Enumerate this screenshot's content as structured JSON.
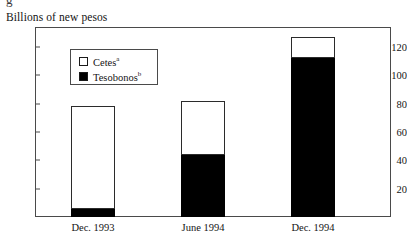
{
  "figure": {
    "top_clipped_glyph": "g",
    "axis_title": "Billions of new pesos"
  },
  "legend": {
    "position": "inside-top-left",
    "items": [
      {
        "label": "Cetes",
        "footnote": "a",
        "swatch": "white-square-swatch"
      },
      {
        "label": "Tesobonos",
        "footnote": "b",
        "swatch": "black-square-swatch"
      }
    ]
  },
  "chart_data": {
    "type": "bar",
    "subtype": "stacked-column",
    "title": "",
    "subtitle": "",
    "xlabel": "",
    "ylabel": "Billions of new pesos",
    "categories": [
      "Dec. 1993",
      "June 1994",
      "Dec. 1994"
    ],
    "series": [
      {
        "name": "Tesobonos",
        "color": "#000000",
        "values": [
          6,
          44,
          112
        ]
      },
      {
        "name": "Cetes",
        "color": "#ffffff",
        "values": [
          72,
          38,
          15
        ]
      }
    ],
    "totals": [
      78,
      82,
      127
    ],
    "ylim": [
      0,
      134
    ],
    "yticks": [
      20,
      40,
      60,
      80,
      100,
      120
    ],
    "ytick_labels": [
      "20",
      "40",
      "60",
      "80",
      "100",
      "120"
    ],
    "grid": false,
    "legend_position": "upper left inside plot"
  },
  "colors": {
    "tesobonos": "#000000",
    "cetes": "#ffffff",
    "frame": "#4a4a4a",
    "text": "#141414",
    "background": "#ffffff"
  }
}
